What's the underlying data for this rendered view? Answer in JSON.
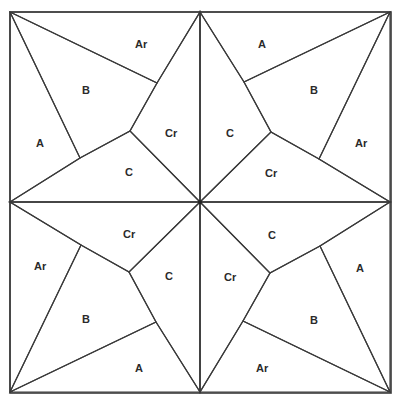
{
  "diagram": {
    "colors": {
      "background_print": "#e6e6e6",
      "plaid": "#f8f8f8",
      "dark": "#a9a9a9",
      "seam": "#3a3a3a",
      "label": "#2a2a2a"
    },
    "quadrants": [
      {
        "position": "top-left",
        "labels": {
          "A": "A",
          "Ar": "Ar",
          "B": "B",
          "C": "C",
          "Cr": "Cr"
        }
      },
      {
        "position": "top-right",
        "labels": {
          "A": "A",
          "Ar": "Ar",
          "B": "B",
          "C": "C",
          "Cr": "Cr"
        }
      },
      {
        "position": "bottom-left",
        "labels": {
          "A": "A",
          "Ar": "Ar",
          "B": "B",
          "C": "C",
          "Cr": "Cr"
        }
      },
      {
        "position": "bottom-right",
        "labels": {
          "A": "A",
          "Ar": "Ar",
          "B": "B",
          "C": "C",
          "Cr": "Cr"
        }
      }
    ]
  }
}
